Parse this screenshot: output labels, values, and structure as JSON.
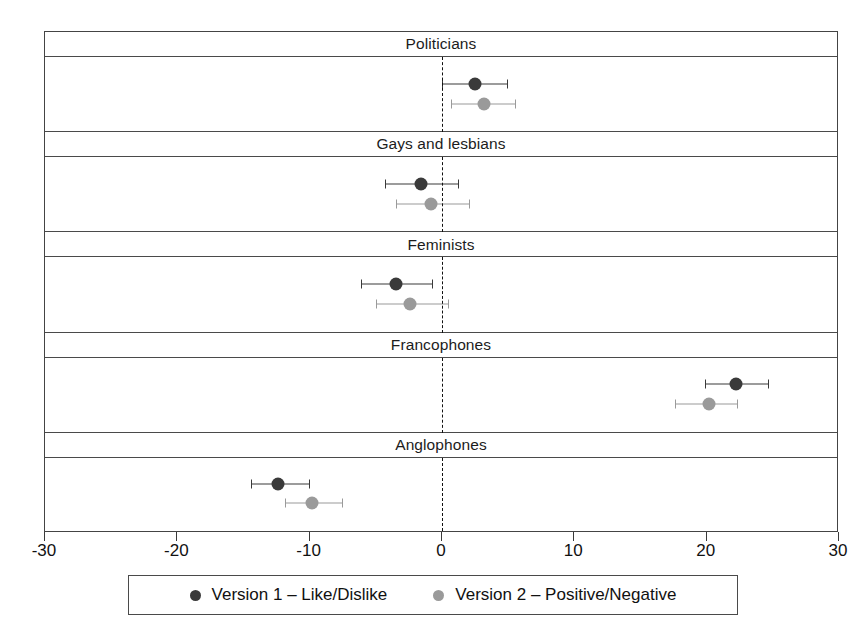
{
  "chart_data": {
    "type": "scatter",
    "plot_style": "coefficient-plot-with-confidence-intervals",
    "title": "",
    "subtitle": "",
    "xlabel": "",
    "ylabel": "",
    "xlim": [
      -30,
      30
    ],
    "xticks": [
      -30,
      -20,
      -10,
      0,
      10,
      20,
      30
    ],
    "xtick_labels": [
      "-30",
      "-20",
      "-10",
      "0",
      "10",
      "20",
      "30"
    ],
    "grid": false,
    "zero_reference_line": 0,
    "zero_reference_style": "dashed",
    "legend_position": "bottom",
    "panel_titles": [
      "Politicians",
      "Gays and lesbians",
      "Feminists",
      "Francophones",
      "Anglophones"
    ],
    "series": [
      {
        "name": "Version 1 – Like/Dislike",
        "color": "#3a3a3a",
        "values": [
          2.5,
          -1.6,
          -3.5,
          22.2,
          -12.4
        ],
        "ci_low": [
          0.0,
          -4.3,
          -6.1,
          19.9,
          -14.4
        ],
        "ci_high": [
          5.0,
          1.3,
          -0.7,
          24.7,
          -10.0
        ]
      },
      {
        "name": "Version 2 – Positive/Negative",
        "color": "#9a9a9a",
        "values": [
          3.2,
          -0.8,
          -2.4,
          20.2,
          -9.8
        ],
        "ci_low": [
          0.7,
          -3.5,
          -5.0,
          17.6,
          -11.9
        ],
        "ci_high": [
          5.6,
          2.1,
          0.5,
          22.4,
          -7.5
        ]
      }
    ],
    "panels": [
      {
        "title": "Politicians",
        "points": [
          {
            "series": "Version 1 – Like/Dislike",
            "estimate": 2.5,
            "ci_low": 0.0,
            "ci_high": 5.0
          },
          {
            "series": "Version 2 – Positive/Negative",
            "estimate": 3.2,
            "ci_low": 0.7,
            "ci_high": 5.6
          }
        ]
      },
      {
        "title": "Gays and lesbians",
        "points": [
          {
            "series": "Version 1 – Like/Dislike",
            "estimate": -1.6,
            "ci_low": -4.3,
            "ci_high": 1.3
          },
          {
            "series": "Version 2 – Positive/Negative",
            "estimate": -0.8,
            "ci_low": -3.5,
            "ci_high": 2.1
          }
        ]
      },
      {
        "title": "Feminists",
        "points": [
          {
            "series": "Version 1 – Like/Dislike",
            "estimate": -3.5,
            "ci_low": -6.1,
            "ci_high": -0.7
          },
          {
            "series": "Version 2 – Positive/Negative",
            "estimate": -2.4,
            "ci_low": -5.0,
            "ci_high": 0.5
          }
        ]
      },
      {
        "title": "Francophones",
        "points": [
          {
            "series": "Version 1 – Like/Dislike",
            "estimate": 22.2,
            "ci_low": 19.9,
            "ci_high": 24.7
          },
          {
            "series": "Version 2 – Positive/Negative",
            "estimate": 20.2,
            "ci_low": 17.6,
            "ci_high": 22.4
          }
        ]
      },
      {
        "title": "Anglophones",
        "points": [
          {
            "series": "Version 1 – Like/Dislike",
            "estimate": -12.4,
            "ci_low": -14.4,
            "ci_high": -10.0
          },
          {
            "series": "Version 2 – Positive/Negative",
            "estimate": -9.8,
            "ci_low": -11.9,
            "ci_high": -7.5
          }
        ]
      }
    ]
  },
  "axis": {
    "tick_labels": [
      "-30",
      "-20",
      "-10",
      "0",
      "10",
      "20",
      "30"
    ]
  },
  "panels": [
    {
      "title": "Politicians"
    },
    {
      "title": "Gays and lesbians"
    },
    {
      "title": "Feminists"
    },
    {
      "title": "Francophones"
    },
    {
      "title": "Anglophones"
    }
  ],
  "legend": {
    "entries": [
      {
        "label": "Version 1 – Like/Dislike",
        "color": "#3a3a3a"
      },
      {
        "label": "Version 2 – Positive/Negative",
        "color": "#9a9a9a"
      }
    ]
  },
  "colors": {
    "version1": "#3a3a3a",
    "version2": "#9a9a9a",
    "frame": "#444444",
    "background": "#ffffff"
  }
}
